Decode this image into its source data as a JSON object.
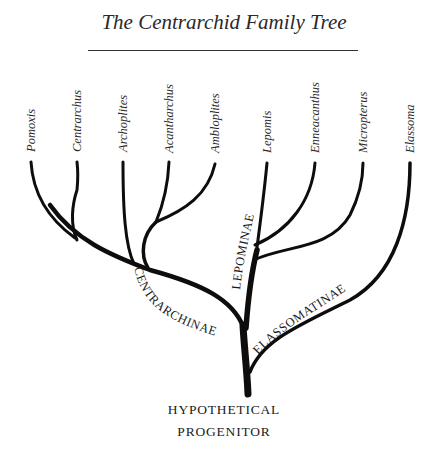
{
  "title": "The Centrarchid Family Tree",
  "taxa": [
    {
      "name": "Pomoxis",
      "x": 31
    },
    {
      "name": "Centrarchus",
      "x": 77
    },
    {
      "name": "Archoplites",
      "x": 123
    },
    {
      "name": "Acantharchus",
      "x": 169
    },
    {
      "name": "Ambloplites",
      "x": 215
    },
    {
      "name": "Lepomis",
      "x": 267
    },
    {
      "name": "Enneacanthus",
      "x": 315
    },
    {
      "name": "Micropterus",
      "x": 363
    },
    {
      "name": "Elassoma",
      "x": 410
    }
  ],
  "subfamilies": {
    "centrarchinae": "CENTRARCHINAE",
    "lepominae": "LEPOMINAE",
    "elassomatinae": "ELASSOMATINAE"
  },
  "root": {
    "line1": "HYPOTHETICAL",
    "line2": "PROGENITOR"
  },
  "colors": {
    "branch": "#0d0d0d",
    "text": "#222222"
  }
}
